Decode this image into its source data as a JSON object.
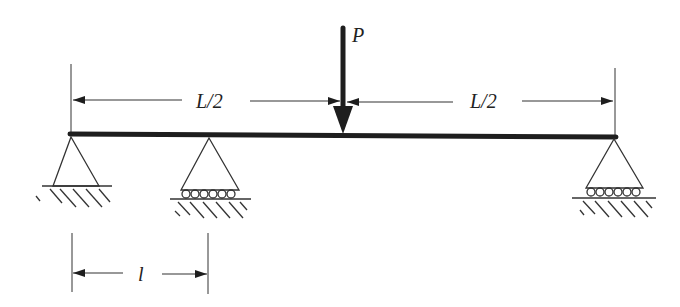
{
  "diagram": {
    "colors": {
      "ink": "#1e1e1e",
      "background": "#ffffff"
    },
    "load": {
      "label": "P",
      "x": 343
    },
    "beam": {
      "x1": 70,
      "x2": 615,
      "y": 135
    },
    "dimensions": {
      "left_half": {
        "label": "L/2"
      },
      "right_half": {
        "label": "L/2"
      },
      "support_spacing": {
        "label": "l"
      }
    },
    "supports": [
      {
        "type": "pin",
        "x": 71
      },
      {
        "type": "roller",
        "x": 209
      },
      {
        "type": "roller",
        "x": 614
      }
    ]
  }
}
